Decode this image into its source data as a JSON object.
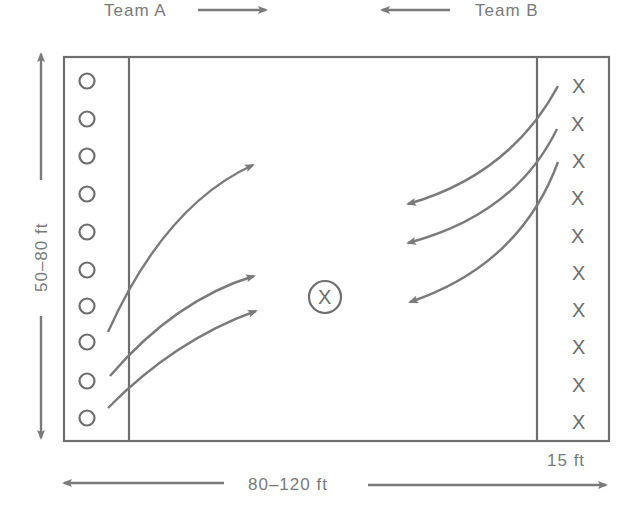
{
  "labels": {
    "team_a": "Team  A",
    "team_b": "Team  B",
    "height": "50–80 ft",
    "width": "80–120 ft",
    "zone": "15 ft"
  },
  "players": {
    "team_a_symbol": "O",
    "team_a_count": 10,
    "team_b_symbol": "X",
    "team_b_count": 10,
    "center_symbol": "X"
  },
  "colors": {
    "line": "#6e6e6e",
    "text": "#7a7a7a",
    "background": "#ffffff"
  }
}
